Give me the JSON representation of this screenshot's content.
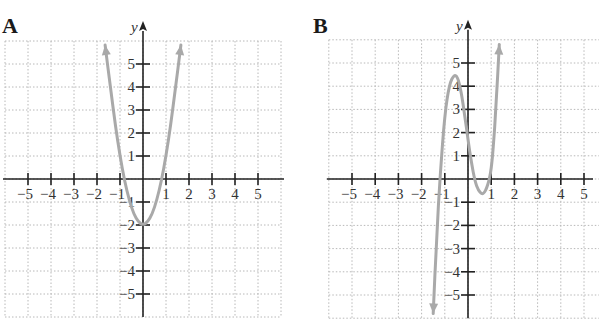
{
  "chart_data": [
    {
      "type": "line",
      "panel_label": "A",
      "title": "A",
      "xlabel": "x",
      "ylabel": "y",
      "xlim": [
        -6,
        6
      ],
      "ylim": [
        -6,
        6
      ],
      "grid": true,
      "x_ticks": [
        -5,
        -4,
        -3,
        -2,
        -1,
        1,
        2,
        3,
        4,
        5
      ],
      "y_ticks": [
        5,
        4,
        3,
        2,
        1,
        -1,
        -2,
        -3,
        -4,
        -5
      ],
      "series": [
        {
          "name": "f(x) ≈ 3x² − 2",
          "description": "Upward parabola, vertex (0, -2), x-intercepts near ±0.82, arrows at both ends",
          "x": [
            -1.65,
            -1.4,
            -1.2,
            -1.0,
            -0.8,
            -0.6,
            -0.4,
            -0.2,
            0,
            0.2,
            0.4,
            0.6,
            0.8,
            1.0,
            1.2,
            1.4,
            1.65
          ],
          "y": [
            6.17,
            3.88,
            2.32,
            1.0,
            -0.08,
            -0.92,
            -1.52,
            -1.88,
            -2.0,
            -1.88,
            -1.52,
            -0.92,
            -0.08,
            1.0,
            2.32,
            3.88,
            6.17
          ],
          "color": "#a9a9a9"
        }
      ]
    },
    {
      "type": "line",
      "panel_label": "B",
      "title": "B",
      "xlabel": "x",
      "ylabel": "y",
      "xlim": [
        -6,
        6
      ],
      "ylim": [
        -6,
        6
      ],
      "grid": true,
      "x_ticks": [
        -5,
        -4,
        -3,
        -2,
        -1,
        1,
        2,
        3,
        4,
        5
      ],
      "y_ticks": [
        5,
        4,
        3,
        2,
        1,
        -1,
        -2,
        -3,
        -4,
        -5
      ],
      "series": [
        {
          "name": "cubic",
          "description": "Cubic: falls to -∞ on left, local max ≈ (-0.5, 4.5), y-intercept ≈ 1.7, local min ≈ (0.7, -0.6), rises to +∞ on right; x-intercepts ≈ -1.2, 0.4, 0.95",
          "x": [
            -1.5,
            -1.35,
            -1.2,
            -1.0,
            -0.8,
            -0.6,
            -0.45,
            -0.3,
            -0.15,
            0,
            0.15,
            0.3,
            0.45,
            0.6,
            0.7,
            0.8,
            0.9,
            1.0,
            1.1,
            1.2,
            1.35
          ],
          "y": [
            -5.8,
            -2.5,
            0.2,
            2.8,
            4.1,
            4.5,
            4.4,
            3.8,
            2.8,
            1.7,
            0.7,
            -0.1,
            -0.5,
            -0.65,
            -0.6,
            -0.4,
            -0.1,
            0.4,
            1.5,
            3.0,
            5.8
          ],
          "color": "#a9a9a9"
        }
      ]
    }
  ],
  "panels": {
    "a": {
      "label": "A",
      "x_axis_label": "x",
      "y_axis_label": "y"
    },
    "b": {
      "label": "B",
      "x_axis_label": "x",
      "y_axis_label": "y"
    }
  },
  "tick_labels": {
    "x": [
      "−5",
      "−4",
      "−3",
      "−2",
      "−1",
      "1",
      "2",
      "3",
      "4",
      "5"
    ],
    "y_pos": [
      "5",
      "4",
      "3",
      "2",
      "1"
    ],
    "y_neg": [
      "−1",
      "−2",
      "−3",
      "−4",
      "−5"
    ]
  }
}
